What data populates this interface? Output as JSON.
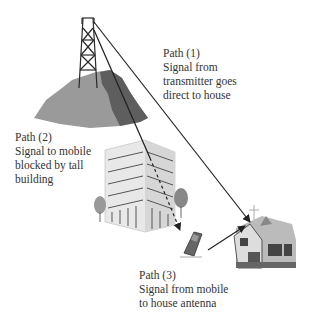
{
  "diagram": {
    "nodes": [
      {
        "id": "transmitter",
        "name": "Transmitter tower on hill"
      },
      {
        "id": "building",
        "name": "Tall building"
      },
      {
        "id": "mobile",
        "name": "Mobile phone"
      },
      {
        "id": "house",
        "name": "House with antenna"
      }
    ],
    "paths": [
      {
        "id": "path1",
        "title": "Path (1)",
        "lines": [
          "Signal from",
          "transmitter goes",
          "direct to house"
        ],
        "from": "transmitter",
        "to": "house",
        "style": "solid"
      },
      {
        "id": "path2",
        "title": "Path (2)",
        "lines": [
          "Signal to mobile",
          "blocked by tall",
          "building"
        ],
        "from": "transmitter",
        "to": "mobile",
        "style": "solid-then-dashed"
      },
      {
        "id": "path3",
        "title": "Path (3)",
        "lines": [
          "Signal from mobile",
          "to house antenna"
        ],
        "from": "mobile",
        "to": "house",
        "style": "solid"
      }
    ],
    "colors": {
      "line": "#222222",
      "hill_light": "#9a9a9a",
      "hill_dark": "#5e5e5e",
      "building": "#e6e6e6",
      "text": "#333333"
    }
  }
}
